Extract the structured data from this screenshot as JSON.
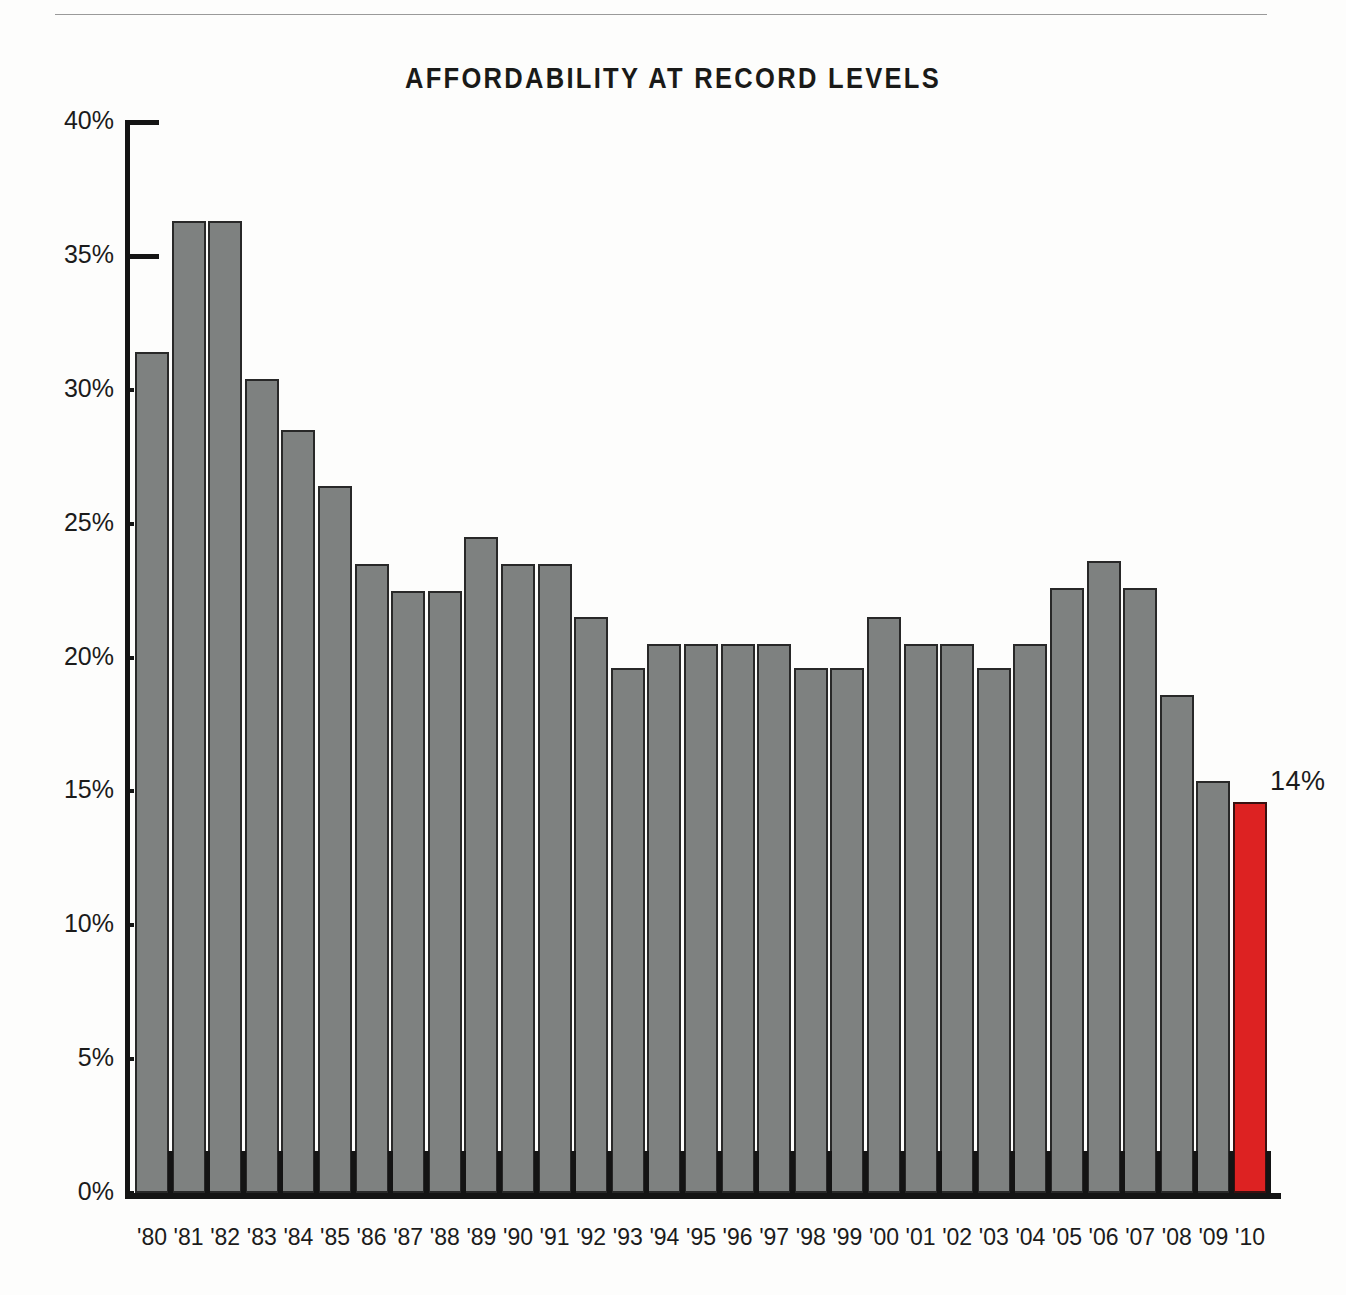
{
  "page": {
    "background": "#fdfdfc",
    "rule_color": "#9a9a9a"
  },
  "chart_data": {
    "type": "bar",
    "title": "AFFORDABILITY AT RECORD LEVELS",
    "xlabel": "",
    "ylabel": "",
    "ylim": [
      0,
      40
    ],
    "grid": false,
    "legend": null,
    "y_ticks": [
      0,
      5,
      10,
      15,
      20,
      25,
      30,
      35,
      40
    ],
    "y_tick_labels": [
      "0%",
      "5%",
      "10%",
      "15%",
      "20%",
      "25%",
      "30%",
      "35%",
      "40%"
    ],
    "categories": [
      "'80",
      "'81",
      "'82",
      "'83",
      "'84",
      "'85",
      "'86",
      "'87",
      "'88",
      "'89",
      "'90",
      "'91",
      "'92",
      "'93",
      "'94",
      "'95",
      "'96",
      "'97",
      "'98",
      "'99",
      "'00",
      "'01",
      "'02",
      "'03",
      "'04",
      "'05",
      "'06",
      "'07",
      "'08",
      "'09",
      "'10"
    ],
    "values": [
      31.4,
      36.3,
      36.3,
      30.4,
      28.5,
      26.4,
      23.5,
      22.5,
      22.5,
      24.5,
      23.5,
      23.5,
      21.5,
      19.6,
      20.5,
      20.5,
      20.5,
      20.5,
      19.6,
      19.6,
      21.5,
      20.5,
      20.5,
      19.6,
      20.5,
      22.6,
      23.6,
      22.6,
      18.6,
      15.4,
      14.6
    ],
    "bar_color": "#7e8180",
    "bar_edge_color": "#282828",
    "highlight_index": 30,
    "highlight_color": "#dd2222",
    "annotations": [
      {
        "index": 30,
        "label": "14%"
      }
    ]
  }
}
